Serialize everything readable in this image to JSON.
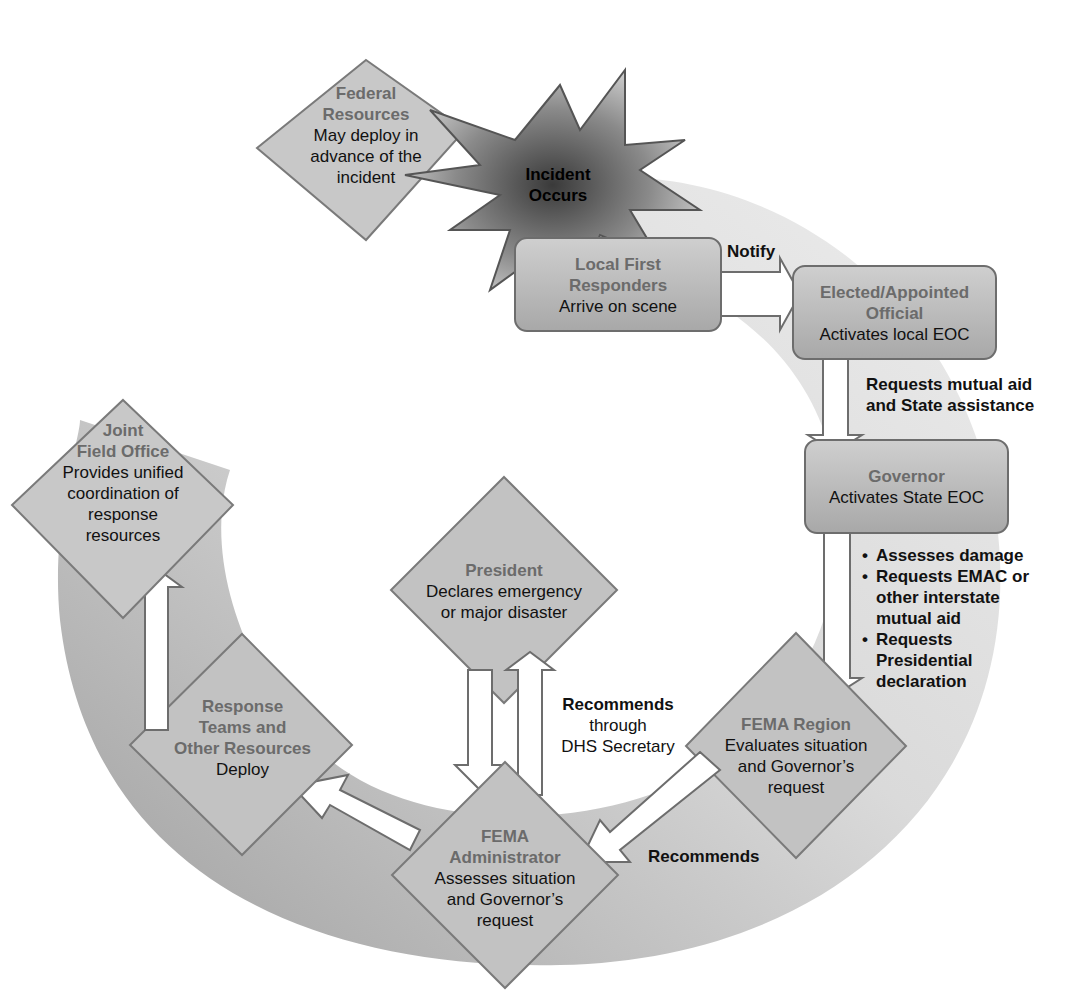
{
  "colors": {
    "ring_light": "#e2e2e2",
    "ring_dark": "#9e9e9e",
    "node_fill": "#c4c4c4",
    "node_stroke": "#7a7a7a",
    "title_text": "#6b6b6b",
    "body_text": "#111111",
    "arrow_fill": "#ffffff",
    "starburst_center": "#444444",
    "starburst_edge": "#bdbdbd"
  },
  "nodes": {
    "federal": {
      "title": "Federal Resources",
      "title_l1": "Federal",
      "title_l2": "Resources",
      "desc_l1": "May deploy in",
      "desc_l2": "advance of the",
      "desc_l3": "incident"
    },
    "incident": {
      "l1": "Incident",
      "l2": "Occurs"
    },
    "local": {
      "title_l1": "Local First",
      "title_l2": "Responders",
      "desc": "Arrive on scene"
    },
    "elected": {
      "title_l1": "Elected/Appointed",
      "title_l2": "Official",
      "desc": "Activates local EOC"
    },
    "governor": {
      "title": "Governor",
      "desc": "Activates State EOC"
    },
    "fema_region": {
      "title": "FEMA Region",
      "desc_l1": "Evaluates situation",
      "desc_l2": "and Governor’s",
      "desc_l3": "request"
    },
    "fema_admin": {
      "title_l1": "FEMA",
      "title_l2": "Administrator",
      "desc_l1": "Assesses situation",
      "desc_l2": "and Governor’s",
      "desc_l3": "request"
    },
    "president": {
      "title": "President",
      "desc_l1": "Declares emergency",
      "desc_l2": "or major disaster"
    },
    "response": {
      "title_l1": "Response",
      "title_l2": "Teams and",
      "title_l3": "Other Resources",
      "desc": "Deploy"
    },
    "jfo": {
      "title_l1": "Joint",
      "title_l2": "Field Office",
      "desc_l1": "Provides unified",
      "desc_l2": "coordination of",
      "desc_l3": "response",
      "desc_l4": "resources"
    }
  },
  "edge_labels": {
    "notify": "Notify",
    "mutual_aid_l1": "Requests mutual aid",
    "mutual_aid_l2": "and State assistance",
    "governor_actions": [
      "Assesses damage",
      "Requests EMAC or other interstate mutual aid",
      "Requests Presidential declaration"
    ],
    "gov_b1": "Assesses damage",
    "gov_b2_l1": "Requests EMAC or",
    "gov_b2_l2": "other interstate",
    "gov_b2_l3": "mutual aid",
    "gov_b3_l1": "Requests",
    "gov_b3_l2": "Presidential",
    "gov_b3_l3": "declaration",
    "region_to_admin": "Recommends",
    "admin_to_president_bold": "Recommends",
    "admin_to_president_l2": "through",
    "admin_to_president_l3": "DHS Secretary"
  }
}
